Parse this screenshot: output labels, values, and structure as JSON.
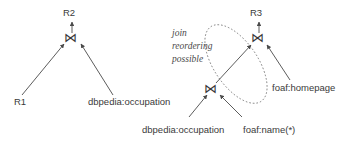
{
  "figure": {
    "type": "query-plan-diagram",
    "background": "#ffffff",
    "stroke_color": "#4a4a4a",
    "text_color": "#3a3a3a",
    "join_glyph": "⋈",
    "join_glyph_name": "bowtie-join-operator"
  },
  "left_plan": {
    "root_label": "R2",
    "join_label": "⋈",
    "leaves": [
      {
        "label": "R1"
      },
      {
        "label": "dbpedia:occupation"
      }
    ]
  },
  "right_plan": {
    "root_label": "R3",
    "upper_join_label": "⋈",
    "lower_join_label": "⋈",
    "leaves": [
      {
        "label": "dbpedia:occupation"
      },
      {
        "label": "foaf:name(*)"
      },
      {
        "label": "foaf:homepage"
      }
    ],
    "annotation": {
      "line1": "join",
      "line2": "reordering",
      "line3": "possible"
    },
    "highlight_shape": "dotted-ellipse"
  }
}
